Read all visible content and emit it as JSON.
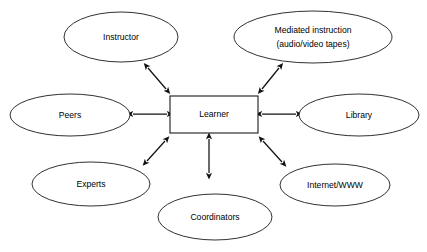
{
  "diagram": {
    "type": "hub-and-spoke concept map",
    "background_color": "#ffffff",
    "stroke_color": "#1a1a1a",
    "text_color": "#000000",
    "center": {
      "id": "learner",
      "label": "Learner",
      "shape": "rectangle",
      "x": 170,
      "y": 96,
      "width": 88,
      "height": 37
    },
    "nodes": [
      {
        "id": "instructor",
        "label": "Instructor",
        "lines": [
          "Instructor"
        ],
        "shape": "ellipse",
        "cx": 121,
        "cy": 37,
        "rx": 57,
        "ry": 25
      },
      {
        "id": "mediated-instruction",
        "label": "Mediated instruction (audio/video tapes)",
        "lines": [
          "Mediated instruction",
          "(audio/video tapes)"
        ],
        "shape": "ellipse",
        "cx": 313,
        "cy": 37,
        "rx": 79,
        "ry": 26
      },
      {
        "id": "peers",
        "label": "Peers",
        "lines": [
          "Peers"
        ],
        "shape": "ellipse",
        "cx": 70,
        "cy": 115,
        "rx": 60,
        "ry": 21
      },
      {
        "id": "library",
        "label": "Library",
        "lines": [
          "Library"
        ],
        "shape": "ellipse",
        "cx": 359,
        "cy": 115,
        "rx": 60,
        "ry": 21
      },
      {
        "id": "experts",
        "label": "Experts",
        "lines": [
          "Experts"
        ],
        "shape": "ellipse",
        "cx": 91,
        "cy": 184,
        "rx": 59,
        "ry": 22
      },
      {
        "id": "coordinators",
        "label": "Coordinators",
        "lines": [
          "Coordinators"
        ],
        "shape": "ellipse",
        "cx": 215,
        "cy": 217,
        "rx": 57,
        "ry": 23
      },
      {
        "id": "internet-www",
        "label": "Internet/WWW",
        "lines": [
          "Internet/WWW"
        ],
        "shape": "ellipse",
        "cx": 335,
        "cy": 185,
        "rx": 55,
        "ry": 21
      }
    ],
    "connectors": [
      {
        "id": "instructor-learner",
        "from": "instructor",
        "to": "learner",
        "arrowheads": "both",
        "x1": 148,
        "y1": 68,
        "x2": 166,
        "y2": 89
      },
      {
        "id": "mediated-instruction-learner",
        "from": "mediated-instruction",
        "to": "learner",
        "arrowheads": "both",
        "x1": 262,
        "y1": 89,
        "x2": 279,
        "y2": 68
      },
      {
        "id": "peers-learner",
        "from": "peers",
        "to": "learner",
        "arrowheads": "both",
        "x1": 133,
        "y1": 114,
        "x2": 167,
        "y2": 114
      },
      {
        "id": "library-learner",
        "from": "library",
        "to": "learner",
        "arrowheads": "both",
        "x1": 262,
        "y1": 114,
        "x2": 296,
        "y2": 114
      },
      {
        "id": "experts-learner",
        "from": "experts",
        "to": "learner",
        "arrowheads": "both",
        "x1": 147,
        "y1": 161,
        "x2": 165,
        "y2": 141
      },
      {
        "id": "coordinators-learner",
        "from": "coordinators",
        "to": "learner",
        "arrowheads": "both",
        "x1": 209,
        "y1": 173,
        "x2": 209,
        "y2": 139
      },
      {
        "id": "internet-www-learner",
        "from": "internet-www",
        "to": "learner",
        "arrowheads": "both",
        "x1": 263,
        "y1": 141,
        "x2": 282,
        "y2": 162
      }
    ]
  }
}
